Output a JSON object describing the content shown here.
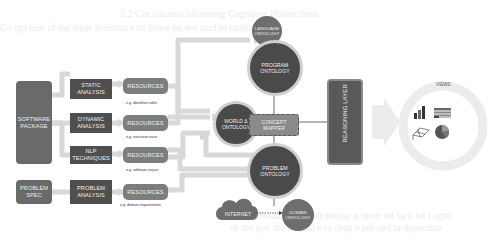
{
  "background_text": [
    "3.2   Cor nazaina   informing Cognitive Distinctions",
    "Co rga  tion of the wear   lexicons  s   ro  llowe  ho  ten   stud  to  tanduc",
    "",
    "",
    "",
    "",
    "Fig. 3  Hesan to lead   alt    ndo  ur  n  ntent  nd  ha  h  ke  f   agm",
    "  of the  pov  the  mental  s  ro   dept   n  eni  ned  ta  dependen",
    "  lo  wo  te  t  h  at  he  n  an  u  at  h  ng  s  l  b  at"
  ],
  "inputs": {
    "software_package": "SOFTWARE PACKAGE",
    "problem_spec": "PROBLEM SPEC"
  },
  "analyses": [
    {
      "label": "STATIC ANALYSIS"
    },
    {
      "label": "DYNAMIC ANALYSIS"
    },
    {
      "label": "NLP TECHNIQUES"
    },
    {
      "label": "PROBLEM ANALYSIS"
    }
  ],
  "resources": [
    {
      "label": "RESOURCES",
      "caption": "e.g. identifiers table"
    },
    {
      "label": "RESOURCES",
      "caption": "e.g. execution trace"
    },
    {
      "label": "RESOURCES",
      "caption": "e.g. software corpus"
    },
    {
      "label": "RESOURCES",
      "caption": "e.g. domain requirements"
    }
  ],
  "ontologies": {
    "language": "LANGUAGE ONTOLOGY",
    "program": "PROGRAM ONTOLOGY",
    "world": "WORLD Δ ONTOLOGY",
    "problem": "PROBLEM ONTOLOGY",
    "domain": "DOMAIN ONTOLOGY"
  },
  "concept_mapper": "CONCEPT MAPPER",
  "reasoning_layer": "REASONING LAYER",
  "internet": "INTERNET",
  "views": {
    "title": "VIEWS",
    "icons": [
      "bar-chart-icon",
      "table-icon",
      "3d-plot-icon",
      "pie-chart-icon"
    ]
  },
  "colors": {
    "dark_box": "#4f4f4f",
    "resource_box": "#7d7d7d",
    "ontology": "#4a4a4a",
    "connector": "#d8d8d8",
    "ring": "#e6e6e6"
  }
}
